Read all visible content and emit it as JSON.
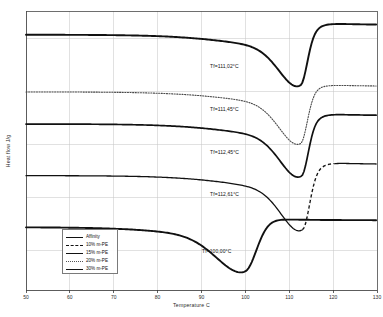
{
  "chart_data": {
    "type": "line",
    "title": "",
    "xlabel": "Temperature C",
    "ylabel": "Heat flow J/g",
    "xlim": [
      50,
      130
    ],
    "ylim": [
      0,
      100
    ],
    "xticks": [
      50,
      60,
      70,
      80,
      90,
      100,
      110,
      120,
      130
    ],
    "xtick_labels": [
      "50",
      "60",
      "70",
      "80",
      "90",
      "100",
      "110",
      "120",
      "130"
    ],
    "ytick_labels": [],
    "grid": "both",
    "legend_position": "lower-left",
    "series": [
      {
        "name": "Affinity",
        "style": "solid",
        "width": 1.9,
        "color": "#111111",
        "baseline": 91.5,
        "tail": 95.0,
        "peak_x": 112.6,
        "peak_depth": 14.5,
        "onset_drop": 6.5,
        "annotation": "Tf=111,02°C"
      },
      {
        "name": "10% m-PE",
        "style": "dotted",
        "width": 1.1,
        "color": "#4a4a4a",
        "baseline": 71.0,
        "tail": 73.0,
        "peak_x": 112.6,
        "peak_depth": 15.0,
        "onset_drop": 6.0,
        "annotation": "Tf=111,45°C"
      },
      {
        "name": "15% m-PE",
        "style": "solid",
        "width": 1.7,
        "color": "#111111",
        "baseline": 59.5,
        "tail": 62.5,
        "peak_x": 112.8,
        "peak_depth": 15.0,
        "onset_drop": 6.5,
        "annotation": "Tf=112,45°C"
      },
      {
        "name": "20% m-PE",
        "style": "dashed",
        "width": 1.3,
        "color": "#111111",
        "baseline": 41.0,
        "tail": 45.0,
        "peak_x": 113.1,
        "peak_depth": 15.5,
        "onset_drop": 7.0,
        "annotation": "Tf=112,61°C"
      },
      {
        "name": "30% m-PE",
        "style": "solid",
        "width": 1.9,
        "color": "#111111",
        "baseline": 22.5,
        "tail": 25.0,
        "peak_x": 100.0,
        "peak_depth": 13.0,
        "onset_drop": 5.0,
        "annotation": "Tf=100,00°C"
      }
    ],
    "annotations": [
      {
        "text": "Tf=111,02°C",
        "x": 210,
        "y": 63
      },
      {
        "text": "Tf=111,45°C",
        "x": 210,
        "y": 106
      },
      {
        "text": "Tf=112,45°C",
        "x": 210,
        "y": 149
      },
      {
        "text": "Tf=112,61°C",
        "x": 210,
        "y": 191
      },
      {
        "text": "Tf=100,00°C",
        "x": 202,
        "y": 248
      }
    ],
    "legend": [
      {
        "label": "Affinity",
        "style": "solid"
      },
      {
        "label": "10% m-PE",
        "style": "dashed"
      },
      {
        "label": "15% m-PE",
        "style": "solid-thin"
      },
      {
        "label": "20% m-PE",
        "style": "dotted"
      },
      {
        "label": "30% m-PE",
        "style": "solid"
      }
    ]
  }
}
